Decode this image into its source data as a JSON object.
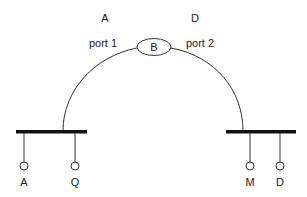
{
  "diagram": {
    "top_labels": {
      "left": "A",
      "right": "D"
    },
    "ports": {
      "left": "port 1",
      "right": "port 2"
    },
    "center_node": {
      "label": "B"
    },
    "left_bus": {
      "terminals": [
        {
          "label": "A"
        },
        {
          "label": "Q"
        }
      ]
    },
    "right_bus": {
      "terminals": [
        {
          "label": "M"
        },
        {
          "label": "D"
        }
      ]
    },
    "colors": {
      "line": "#333333",
      "bar": "#111111",
      "text": "#1a1a1a",
      "background": "#ffffff"
    }
  }
}
